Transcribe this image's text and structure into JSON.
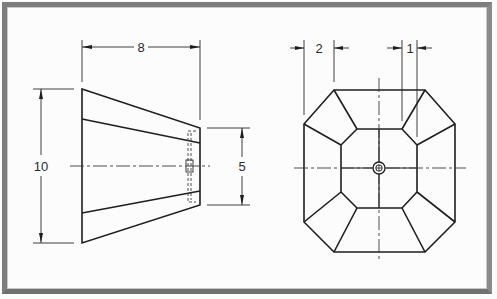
{
  "drawing": {
    "type": "orthographic technical drawing",
    "views": [
      {
        "name": "front-view",
        "shape": "truncated pyramid (trapezoid profile)",
        "dimensions": [
          {
            "id": "length",
            "label": "8",
            "orientation": "horizontal"
          },
          {
            "id": "large-end-height",
            "label": "10",
            "orientation": "vertical"
          },
          {
            "id": "small-end-height",
            "label": "5",
            "orientation": "vertical"
          }
        ]
      },
      {
        "name": "end-view",
        "shape": "octagon with inner octagon and facets",
        "dimensions": [
          {
            "id": "outer-chamfer",
            "label": "2",
            "orientation": "horizontal"
          },
          {
            "id": "inner-chamfer",
            "label": "1",
            "orientation": "horizontal"
          }
        ]
      }
    ],
    "labels": {
      "dim_8": "8",
      "dim_10": "10",
      "dim_5": "5",
      "dim_2": "2",
      "dim_1": "1"
    },
    "colors": {
      "line": "#1e1e1e",
      "frame": "#7d7d7d",
      "paper": "#fcfcfc"
    }
  }
}
